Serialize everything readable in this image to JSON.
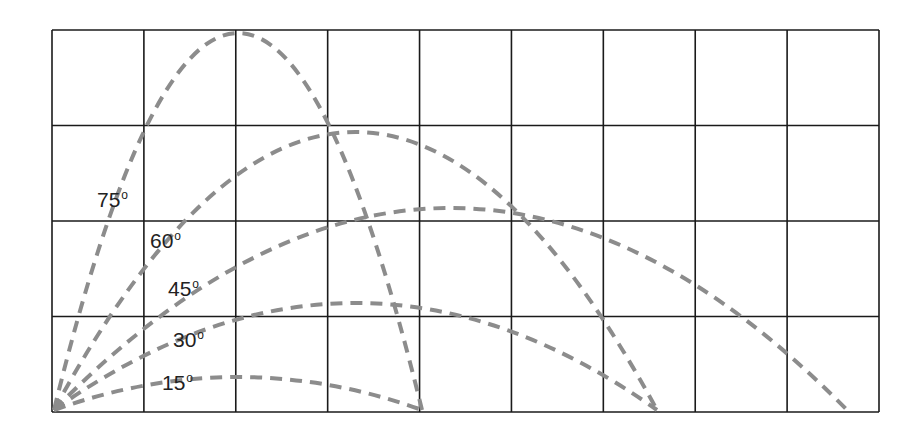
{
  "diagram": {
    "type": "projectile-trajectories",
    "grid": {
      "columns": 9,
      "rows": 4,
      "left": 52,
      "right": 879,
      "top": 30,
      "bottom": 412
    },
    "origin": {
      "x": 54,
      "y": 410
    },
    "trajectory_color": "#8c8c8c",
    "grid_color": "#1a1a1a",
    "degree_symbol": "o",
    "trajectories": [
      {
        "angle": "75",
        "label": "75",
        "land_x": 422,
        "apex_y": 33,
        "label_x": 97,
        "label_y": 189
      },
      {
        "angle": "60",
        "label": "60",
        "land_x": 657,
        "apex_y": 132,
        "label_x": 150,
        "label_y": 230
      },
      {
        "angle": "45",
        "label": "45",
        "land_x": 847,
        "apex_y": 208,
        "label_x": 168,
        "label_y": 278
      },
      {
        "angle": "30",
        "label": "30",
        "land_x": 657,
        "apex_y": 303,
        "label_x": 173,
        "label_y": 329
      },
      {
        "angle": "15",
        "label": "15",
        "land_x": 422,
        "apex_y": 377,
        "label_x": 162,
        "label_y": 372
      }
    ]
  }
}
